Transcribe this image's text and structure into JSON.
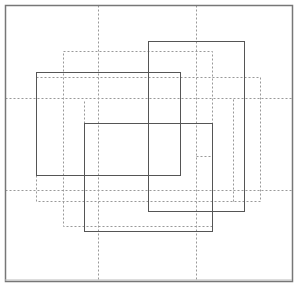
{
  "diagram": {
    "type": "overlapping-rectangles",
    "width": 296,
    "height": 286,
    "colors": {
      "background": "#ffffff",
      "frame": "#777777",
      "solid": "#555555",
      "dotted": "#999999"
    },
    "frame": {
      "x": 5,
      "y": 5,
      "w": 287,
      "h": 276
    },
    "solid_rects": [
      {
        "id": "rect-a",
        "x": 36,
        "y": 72,
        "w": 144,
        "h": 103
      },
      {
        "id": "rect-b",
        "x": 148,
        "y": 41,
        "w": 96,
        "h": 170
      },
      {
        "id": "rect-c",
        "x": 84,
        "y": 123,
        "w": 128,
        "h": 108
      }
    ],
    "dotted_rects": [
      {
        "id": "dotted-rect-1",
        "x": 63,
        "y": 51,
        "w": 149,
        "h": 175
      },
      {
        "id": "dotted-rect-2",
        "x": 36,
        "y": 77,
        "w": 224,
        "h": 124
      }
    ],
    "dotted_lines": [
      {
        "id": "grid-v-1",
        "x1": 98,
        "y1": 5,
        "x2": 98,
        "y2": 281
      },
      {
        "id": "grid-v-2",
        "x1": 196,
        "y1": 5,
        "x2": 196,
        "y2": 281
      },
      {
        "id": "grid-h-1",
        "x1": 5,
        "y1": 98,
        "x2": 292,
        "y2": 98
      },
      {
        "id": "grid-h-2",
        "x1": 5,
        "y1": 190,
        "x2": 292,
        "y2": 190
      },
      {
        "id": "inner-v-1",
        "x1": 84,
        "y1": 101,
        "x2": 84,
        "y2": 123
      },
      {
        "id": "inner-v-2",
        "x1": 233,
        "y1": 99,
        "x2": 233,
        "y2": 201
      },
      {
        "id": "inner-h-1",
        "x1": 84,
        "y1": 123,
        "x2": 100,
        "y2": 123
      },
      {
        "id": "inner-h-2",
        "x1": 196,
        "y1": 156,
        "x2": 212,
        "y2": 156
      }
    ]
  }
}
